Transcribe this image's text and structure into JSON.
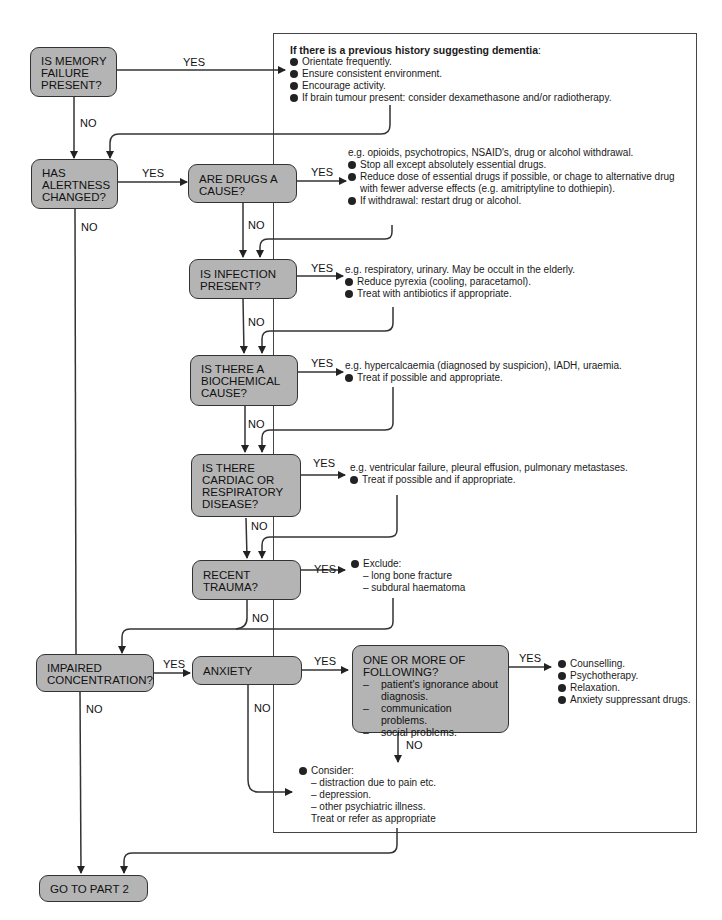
{
  "flowchart": {
    "nodes": {
      "memory": {
        "lines": [
          "IS MEMORY",
          "FAILURE",
          "PRESENT?"
        ]
      },
      "alertness": {
        "lines": [
          "HAS",
          "ALERTNESS",
          "CHANGED?"
        ]
      },
      "drugs": {
        "lines": [
          "ARE DRUGS A",
          "CAUSE?"
        ]
      },
      "infection": {
        "lines": [
          "IS INFECTION",
          "PRESENT?"
        ]
      },
      "biochemical": {
        "lines": [
          "IS THERE A",
          "BIOCHEMICAL",
          "CAUSE?"
        ]
      },
      "cardiac": {
        "lines": [
          "IS THERE",
          "CARDIAC OR",
          "RESPIRATORY",
          "DISEASE?"
        ]
      },
      "trauma": {
        "lines": [
          "RECENT",
          "TRAUMA?"
        ]
      },
      "concentration": {
        "lines": [
          "IMPAIRED",
          "CONCENTRATION?"
        ]
      },
      "anxiety": {
        "lines": [
          "ANXIETY"
        ]
      },
      "following": {
        "lines": [
          "ONE OR MORE OF",
          "FOLLOWING?"
        ],
        "items": [
          "patient's ignorance about",
          "diagnosis.",
          "communication problems.",
          "social problems."
        ]
      },
      "part2": {
        "lines": [
          "GO TO PART 2"
        ]
      }
    },
    "edge_labels": {
      "yes": "YES",
      "no": "NO"
    },
    "notes": {
      "dementia": {
        "title": "If there is a previous history suggesting dementia",
        "title_suffix": ":",
        "bullets": [
          "Orientate frequently.",
          "Ensure consistent environment.",
          "Encourage activity.",
          "If brain tumour present: consider dexamethasone and/or radiotherapy."
        ]
      },
      "drugs": {
        "intro": "e.g. opioids, psychotropics, NSAID's, drug or alcohol withdrawal.",
        "bullets": [
          "Stop all except absolutely essential drugs.",
          "Reduce dose of essential drugs if possible, or chage to alternative drug",
          "If withdrawal: restart drug or alcohol."
        ],
        "continuation": "with fewer adverse effects (e.g. amitriptyline to dothiepin)."
      },
      "infection": {
        "intro": "e.g. respiratory, urinary. May be occult in the elderly.",
        "bullets": [
          "Reduce pyrexia (cooling, paracetamol).",
          "Treat with antibiotics if appropriate."
        ]
      },
      "biochemical": {
        "intro": "e.g. hypercalcaemia (diagnosed by suspicion), IADH, uraemia.",
        "bullets": [
          "Treat if possible and appropriate."
        ]
      },
      "cardiac": {
        "intro": "e.g. ventricular failure, pleural effusion, pulmonary metastases.",
        "bullets": [
          "Treat if possible and if appropriate."
        ]
      },
      "trauma": {
        "bullet": "Exclude:",
        "items": [
          "– long bone fracture",
          "– subdural haematoma"
        ]
      },
      "anxiety_yes": {
        "bullets": [
          "Counselling.",
          "Psychotherapy.",
          "Relaxation.",
          "Anxiety suppressant drugs."
        ]
      },
      "consider": {
        "bullet": "Consider:",
        "items": [
          "– distraction due to pain etc.",
          "– depression.",
          "– other psychiatric illness."
        ],
        "footer": "Treat or refer as appropriate"
      }
    }
  },
  "colors": {
    "box_fill": "#b4b4b4",
    "line": "#333333",
    "background": "#ffffff"
  }
}
